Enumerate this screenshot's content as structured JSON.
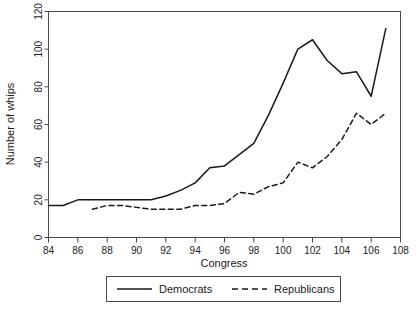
{
  "chart_data": {
    "type": "line",
    "title": "",
    "subtitle": "",
    "xlabel": "Congress",
    "ylabel": "Number of whips",
    "xlim": [
      84,
      108
    ],
    "ylim": [
      0,
      120
    ],
    "xticks": [
      84,
      86,
      88,
      90,
      92,
      94,
      96,
      98,
      100,
      102,
      104,
      106,
      108
    ],
    "yticks": [
      0,
      20,
      40,
      60,
      80,
      100,
      120
    ],
    "grid": false,
    "legend_position": "bottom-center",
    "series": [
      {
        "name": "Democrats",
        "style": "solid",
        "color": "#1a1a1a",
        "x": [
          84,
          85,
          86,
          87,
          88,
          89,
          90,
          91,
          92,
          93,
          94,
          95,
          96,
          97,
          98,
          99,
          100,
          101,
          102,
          103,
          104,
          105,
          106,
          107
        ],
        "values": [
          17,
          17,
          20,
          20,
          20,
          20,
          20,
          20,
          22,
          25,
          29,
          37,
          38,
          44,
          50,
          65,
          82,
          100,
          105,
          94,
          87,
          88,
          75,
          111
        ]
      },
      {
        "name": "Republicans",
        "style": "dashed",
        "color": "#1a1a1a",
        "x": [
          87,
          88,
          89,
          90,
          91,
          92,
          93,
          94,
          95,
          96,
          97,
          98,
          99,
          100,
          101,
          102,
          103,
          104,
          105,
          106,
          107
        ],
        "values": [
          15,
          17,
          17,
          16,
          15,
          15,
          15,
          17,
          17,
          18,
          24,
          23,
          27,
          29,
          40,
          37,
          43,
          52,
          66,
          60,
          66
        ]
      }
    ]
  },
  "legend": {
    "democrats_label": "Democrats",
    "republicans_label": "Republicans"
  },
  "axes": {
    "x_title": "Congress",
    "y_title": "Number of whips"
  }
}
